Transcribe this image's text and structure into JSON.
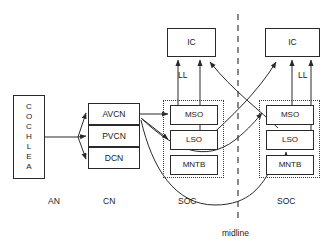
{
  "diagram": {
    "nodes": {
      "cochlea": "COCHLEA",
      "avcn": "AVCN",
      "pvcn": "PVCN",
      "dcn": "DCN",
      "ic_left": "IC",
      "ic_right": "IC",
      "mso_left": "MSO",
      "lso_left": "LSO",
      "mntb_left": "MNTB",
      "mso_right": "MSO",
      "lso_right": "LSO",
      "mntb_right": "MNTB"
    },
    "labels": {
      "an": "AN",
      "cn": "CN",
      "soc_left": "SOC",
      "soc_right": "SOC",
      "midline": "midline",
      "ll_left": "LL",
      "ll_right": "LL"
    },
    "colors": {
      "stroke": "#2a2a2a",
      "dotted": "#3a3a3a",
      "background": "#ffffff",
      "text": "#1a1a1a"
    }
  }
}
